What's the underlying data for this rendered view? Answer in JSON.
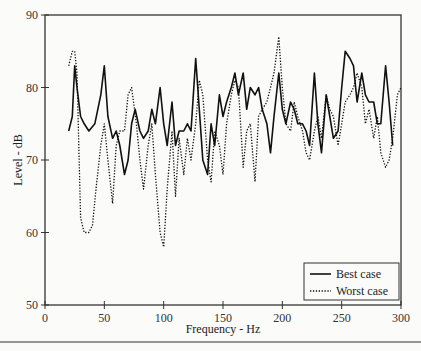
{
  "chart_data": {
    "type": "line",
    "title": "",
    "xlabel": "Frequency - Hz",
    "ylabel": "Level - dB",
    "xlim": [
      0,
      300
    ],
    "ylim": [
      50,
      90
    ],
    "xticks": [
      0,
      50,
      100,
      150,
      200,
      250,
      300
    ],
    "yticks": [
      50,
      60,
      70,
      80,
      90
    ],
    "grid": false,
    "legend_position": "lower right",
    "series": [
      {
        "name": "Best case",
        "style": "solid",
        "x": [
          20,
          23,
          25,
          27,
          30,
          33,
          37,
          42,
          47,
          50,
          53,
          57,
          60,
          63,
          67,
          70,
          73,
          76,
          80,
          83,
          87,
          90,
          93,
          97,
          100,
          103,
          107,
          110,
          113,
          117,
          120,
          123,
          127,
          130,
          133,
          137,
          140,
          143,
          147,
          150,
          153,
          157,
          160,
          163,
          167,
          170,
          173,
          177,
          180,
          183,
          187,
          190,
          193,
          197,
          200,
          203,
          207,
          210,
          213,
          217,
          220,
          223,
          227,
          230,
          233,
          237,
          240,
          243,
          247,
          250,
          253,
          257,
          260,
          263,
          267,
          270,
          273,
          277,
          280,
          283,
          287,
          290,
          293
        ],
        "values": [
          74,
          76,
          83,
          80,
          76,
          75,
          74,
          75,
          79,
          83,
          76,
          73,
          74,
          72,
          68,
          70,
          75,
          77,
          74,
          73,
          74,
          77,
          75,
          80,
          75,
          72,
          78,
          72,
          74,
          74,
          75,
          74,
          84,
          77,
          70,
          68,
          75,
          72,
          79,
          76,
          78,
          80,
          82,
          79,
          82,
          77,
          80,
          79,
          80,
          77,
          75,
          71,
          76,
          82,
          77,
          75,
          78,
          77,
          75,
          75,
          74,
          72,
          82,
          75,
          71,
          79,
          76,
          73,
          74,
          80,
          85,
          84,
          83,
          78,
          82,
          79,
          78,
          78,
          75,
          75,
          83,
          78,
          72
        ]
      },
      {
        "name": "Worst case",
        "style": "dotted",
        "x": [
          20,
          23,
          25,
          27,
          30,
          33,
          37,
          40,
          43,
          47,
          50,
          53,
          57,
          60,
          63,
          67,
          70,
          73,
          77,
          80,
          83,
          87,
          90,
          93,
          97,
          100,
          103,
          107,
          110,
          113,
          117,
          120,
          123,
          127,
          130,
          133,
          137,
          140,
          143,
          147,
          150,
          153,
          157,
          160,
          163,
          167,
          170,
          173,
          177,
          180,
          183,
          187,
          190,
          193,
          197,
          200,
          203,
          207,
          210,
          213,
          217,
          220,
          223,
          227,
          230,
          233,
          237,
          240,
          243,
          247,
          250,
          253,
          257,
          260,
          263,
          267,
          270,
          273,
          277,
          280,
          283,
          287,
          290,
          293,
          297,
          300
        ],
        "values": [
          83,
          85,
          85,
          82,
          62,
          60,
          60,
          61,
          66,
          72,
          75,
          70,
          64,
          72,
          74,
          74,
          79,
          80,
          75,
          70,
          66,
          72,
          75,
          68,
          60,
          58,
          66,
          74,
          65,
          73,
          68,
          73,
          70,
          75,
          81,
          79,
          70,
          67,
          74,
          72,
          68,
          75,
          79,
          81,
          80,
          69,
          74,
          75,
          67,
          76,
          77,
          78,
          80,
          82,
          87,
          80,
          75,
          74,
          78,
          76,
          74,
          71,
          70,
          74,
          76,
          73,
          79,
          77,
          76,
          72,
          75,
          78,
          79,
          80,
          82,
          80,
          75,
          77,
          73,
          76,
          71,
          69,
          70,
          73,
          79,
          80
        ]
      }
    ]
  },
  "page": {
    "footer_text": ""
  }
}
